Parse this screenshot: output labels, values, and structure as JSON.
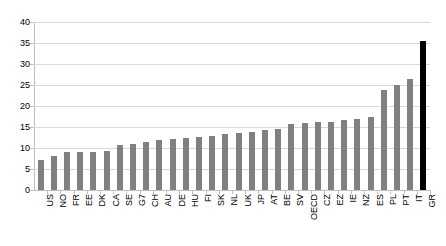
{
  "chart_data": {
    "type": "bar",
    "title": "",
    "subtitle": "",
    "xlabel": "",
    "ylabel": "",
    "ylim": [
      0,
      40
    ],
    "ytick_step": 5,
    "yticks": [
      "0",
      "5",
      "10",
      "15",
      "20",
      "25",
      "30",
      "35",
      "40"
    ],
    "grid": true,
    "legend": false,
    "legend_position": "none",
    "bar_color": "#808080",
    "highlight_color": "#000000",
    "highlight_category": "GR",
    "categories": [
      "US",
      "NO",
      "FR",
      "EE",
      "DK",
      "CA",
      "SE",
      "G7",
      "CH",
      "AU",
      "DE",
      "HU",
      "FI",
      "SK",
      "NL",
      "UK",
      "JP",
      "AT",
      "BE",
      "SV",
      "OECD",
      "CZ",
      "EZ",
      "IE",
      "NZ",
      "ES",
      "PL",
      "PT",
      "IT",
      "GR"
    ],
    "values": [
      7.2,
      8.0,
      9.0,
      9.0,
      9.1,
      9.3,
      10.6,
      11.0,
      11.5,
      11.9,
      12.1,
      12.5,
      12.7,
      12.9,
      13.4,
      13.6,
      13.8,
      14.2,
      14.6,
      15.8,
      16.0,
      16.1,
      16.3,
      16.6,
      16.9,
      17.5,
      23.8,
      25.0,
      26.5,
      35.5
    ]
  }
}
